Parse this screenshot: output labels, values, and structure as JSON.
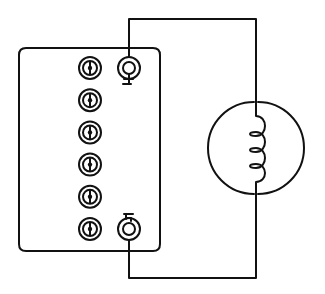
{
  "diagram": {
    "title": "",
    "ink_color": "#111111",
    "background_color": "#ffffff",
    "panel": {
      "left_terminal_column": {
        "count": 6,
        "icon": "coaxial-terminal-icon"
      },
      "right_terminals": [
        {
          "id": "upper-ring-terminal",
          "marking": "+",
          "icon": "ring-terminal-icon"
        },
        {
          "id": "lower-ring-terminal",
          "marking": "−",
          "icon": "ring-terminal-icon"
        }
      ]
    },
    "load": {
      "name": "lamp",
      "icon": "filament-lamp-icon",
      "filament_loops": 3
    },
    "wires": [
      {
        "from": "upper-ring-terminal",
        "to": "lamp-top"
      },
      {
        "from": "lower-ring-terminal",
        "to": "lamp-bottom"
      }
    ]
  }
}
